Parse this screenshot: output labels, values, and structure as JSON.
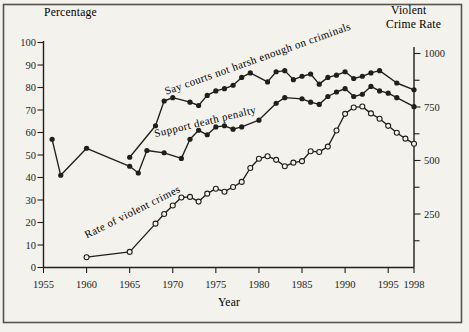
{
  "figure": {
    "background": "#f3f2ed",
    "ink": "#211f1a",
    "border_color": "#55534c"
  },
  "chart_data": {
    "type": "line",
    "title": "",
    "x_axis": {
      "label": "Year",
      "min": 1955,
      "max": 1998,
      "ticks": [
        1955,
        1960,
        1965,
        1970,
        1975,
        1980,
        1985,
        1990,
        1995,
        1998
      ]
    },
    "left_axis": {
      "label": "Percentage",
      "min": 0,
      "max": 100,
      "ticks": [
        0,
        10,
        20,
        30,
        40,
        50,
        60,
        70,
        80,
        90,
        100
      ]
    },
    "right_axis": {
      "label": "Violent Crime Rate",
      "label_lines": [
        "Violent",
        "Crime Rate"
      ],
      "min": 0,
      "max": 1000,
      "major_ticks": [
        250,
        500,
        750,
        1000
      ],
      "minor_ticks": [
        125,
        375,
        625,
        875
      ]
    },
    "series": [
      {
        "name": "Say courts not harsh enough on criminals",
        "axis": "left",
        "marker": "filled",
        "x": [
          1965,
          1968,
          1969,
          1970,
          1972,
          1973,
          1974,
          1975,
          1976,
          1977,
          1978,
          1979,
          1981,
          1982,
          1983,
          1984,
          1985,
          1986,
          1987,
          1988,
          1989,
          1990,
          1991,
          1992,
          1993,
          1994,
          1996,
          1998
        ],
        "y": [
          49,
          63,
          74,
          75.5,
          73.5,
          72,
          76.5,
          78.5,
          79.5,
          81,
          84.5,
          86.5,
          82.5,
          87,
          87.5,
          83.5,
          85,
          86,
          81.5,
          84.5,
          85.5,
          87,
          84,
          85,
          86.5,
          87.5,
          82,
          79
        ]
      },
      {
        "name": "Support death penalty",
        "axis": "left",
        "marker": "filled",
        "x": [
          1956,
          1957,
          1960,
          1965,
          1966,
          1967,
          1969,
          1971,
          1972,
          1973,
          1974,
          1975,
          1976,
          1977,
          1978,
          1980,
          1982,
          1983,
          1985,
          1986,
          1987,
          1988,
          1989,
          1990,
          1991,
          1992,
          1993,
          1994,
          1995,
          1996,
          1998
        ],
        "y": [
          57,
          41,
          53,
          45,
          42,
          52,
          51,
          48.5,
          57,
          61,
          59,
          62.5,
          63,
          61.5,
          62.5,
          65.5,
          73,
          75.5,
          75,
          73.5,
          72.5,
          76,
          78,
          79.5,
          76,
          77,
          80.5,
          78.5,
          77.5,
          75.5,
          71.5
        ]
      },
      {
        "name": "Rate of violent crimes",
        "axis": "right",
        "marker": "open",
        "x": [
          1960,
          1965,
          1968,
          1969,
          1970,
          1971,
          1972,
          1973,
          1974,
          1975,
          1976,
          1977,
          1978,
          1979,
          1980,
          1981,
          1982,
          1983,
          1984,
          1985,
          1986,
          1987,
          1988,
          1989,
          1990,
          1991,
          1992,
          1993,
          1994,
          1995,
          1996,
          1997,
          1998
        ],
        "y": [
          48,
          73,
          205,
          250,
          290,
          327,
          330,
          308,
          345,
          368,
          354,
          376,
          400,
          465,
          508,
          520,
          503,
          473,
          490,
          497,
          543,
          540,
          565,
          640,
          718,
          748,
          752,
          720,
          695,
          662,
          630,
          602,
          578
        ]
      }
    ]
  }
}
